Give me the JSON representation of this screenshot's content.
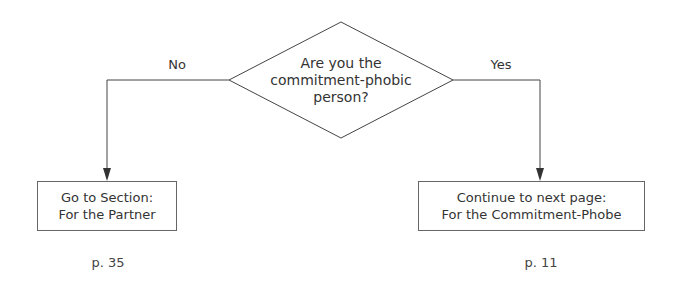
{
  "decision": {
    "lines": [
      "Are you the",
      "commitment-phobic",
      "person?"
    ]
  },
  "branches": {
    "no": {
      "label": "No",
      "box_lines": [
        "Go to Section:",
        "For the Partner"
      ],
      "page": "p. 35"
    },
    "yes": {
      "label": "Yes",
      "box_lines": [
        "Continue to next page:",
        "For the Commitment-Phobe"
      ],
      "page": "p. 11"
    }
  },
  "colors": {
    "line": "#444444",
    "text": "#333333",
    "background": "#ffffff"
  }
}
